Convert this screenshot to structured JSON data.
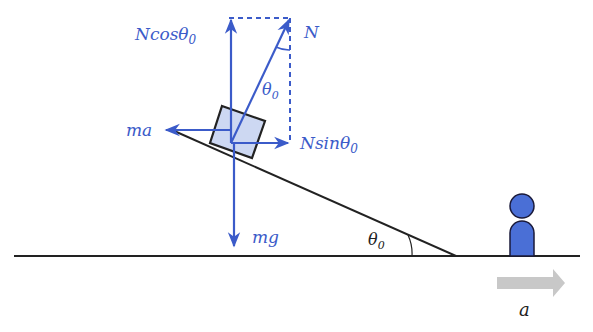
{
  "labels": {
    "n_cos": "Ncosθ",
    "n_cos_sub": "0",
    "n": "N",
    "theta_n": "θ",
    "theta_n_sub": "0",
    "ma": "ma",
    "n_sin": "Nsinθ",
    "n_sin_sub": "0",
    "mg": "mg",
    "theta_incline": "θ",
    "theta_incline_sub": "0",
    "accel": "a"
  },
  "colors": {
    "force": "#3b5bc9",
    "block_fill": "#cdd8f2",
    "person": "#4a6fd6",
    "accel_arrow": "#c8c8c8",
    "line": "#222222"
  }
}
